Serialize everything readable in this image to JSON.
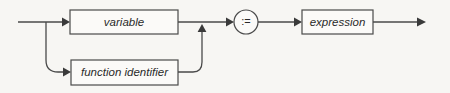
{
  "diagram": {
    "kind": "railroad-syntax-diagram",
    "background_color": "#f7f6f3",
    "line_color": "#4a4a4a",
    "text_color": "#2a2a2a",
    "nodes": {
      "variable": {
        "label": "variable",
        "shape": "rectangle"
      },
      "function_identifier": {
        "label": "function identifier",
        "shape": "rectangle"
      },
      "assign_operator": {
        "label": ":=",
        "shape": "circle"
      },
      "expression": {
        "label": "expression",
        "shape": "rectangle"
      }
    },
    "paths": [
      "entry -> variable -> := -> expression -> exit",
      "entry -> function identifier -> := -> expression -> exit"
    ]
  }
}
